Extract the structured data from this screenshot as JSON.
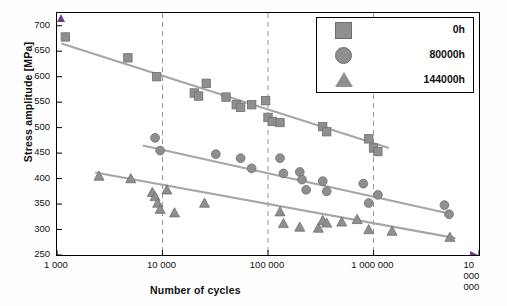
{
  "chart_data": {
    "type": "scatter",
    "title": "",
    "xlabel": "Number of cycles",
    "ylabel": "Stress amplitude [MPa]",
    "xscale": "log",
    "xlim": [
      1000,
      10000000
    ],
    "ylim": [
      250,
      725
    ],
    "yticks": [
      250,
      300,
      350,
      400,
      450,
      500,
      550,
      600,
      650,
      700
    ],
    "xticks": [
      1000,
      10000,
      100000,
      1000000,
      10000000
    ],
    "xticklabels": [
      "1 000",
      "10 000",
      "100 000",
      "1 000 000",
      "10 000 000"
    ],
    "grid": "vertical dashed gridlines at 10 000, 100 000, 1 000 000",
    "legend_position": "top-right",
    "series": [
      {
        "name": "0h",
        "marker": "square",
        "color": "#8f8f8f",
        "points": [
          [
            1200,
            678
          ],
          [
            4700,
            637
          ],
          [
            8800,
            600
          ],
          [
            20000,
            568
          ],
          [
            22000,
            562
          ],
          [
            26000,
            587
          ],
          [
            40000,
            560
          ],
          [
            50000,
            545
          ],
          [
            55000,
            540
          ],
          [
            70000,
            545
          ],
          [
            95000,
            553
          ],
          [
            100000,
            520
          ],
          [
            110000,
            512
          ],
          [
            130000,
            510
          ],
          [
            330000,
            502
          ],
          [
            360000,
            492
          ],
          [
            900000,
            478
          ],
          [
            1000000,
            460
          ],
          [
            1100000,
            453
          ]
        ],
        "trend": [
          [
            1100,
            665
          ],
          [
            1400000,
            460
          ]
        ]
      },
      {
        "name": "80000h",
        "marker": "circle",
        "color": "#8f8f8f",
        "points": [
          [
            8500,
            480
          ],
          [
            9500,
            455
          ],
          [
            32000,
            448
          ],
          [
            55000,
            440
          ],
          [
            70000,
            420
          ],
          [
            130000,
            440
          ],
          [
            140000,
            410
          ],
          [
            200000,
            413
          ],
          [
            210000,
            398
          ],
          [
            230000,
            378
          ],
          [
            330000,
            395
          ],
          [
            360000,
            375
          ],
          [
            800000,
            390
          ],
          [
            900000,
            352
          ],
          [
            1100000,
            368
          ],
          [
            4700000,
            348
          ],
          [
            5200000,
            330
          ]
        ],
        "trend": [
          [
            6500,
            465
          ],
          [
            5600000,
            330
          ]
        ]
      },
      {
        "name": "144000h",
        "marker": "triangle",
        "color": "#8f8f8f",
        "points": [
          [
            2500,
            405
          ],
          [
            5000,
            400
          ],
          [
            8000,
            373
          ],
          [
            8500,
            365
          ],
          [
            9000,
            352
          ],
          [
            9500,
            340
          ],
          [
            11000,
            378
          ],
          [
            13000,
            333
          ],
          [
            25000,
            352
          ],
          [
            130000,
            335
          ],
          [
            140000,
            312
          ],
          [
            200000,
            305
          ],
          [
            300000,
            303
          ],
          [
            330000,
            318
          ],
          [
            360000,
            313
          ],
          [
            500000,
            315
          ],
          [
            700000,
            320
          ],
          [
            900000,
            300
          ],
          [
            1500000,
            297
          ],
          [
            5300000,
            285
          ]
        ],
        "trend": [
          [
            2300,
            412
          ],
          [
            6000000,
            283
          ]
        ]
      }
    ]
  },
  "legend": {
    "items": [
      {
        "label": "0h",
        "marker": "square-marker"
      },
      {
        "label": "80000h",
        "marker": "circle-marker"
      },
      {
        "label": "144000h",
        "marker": "triangle-marker"
      }
    ]
  }
}
